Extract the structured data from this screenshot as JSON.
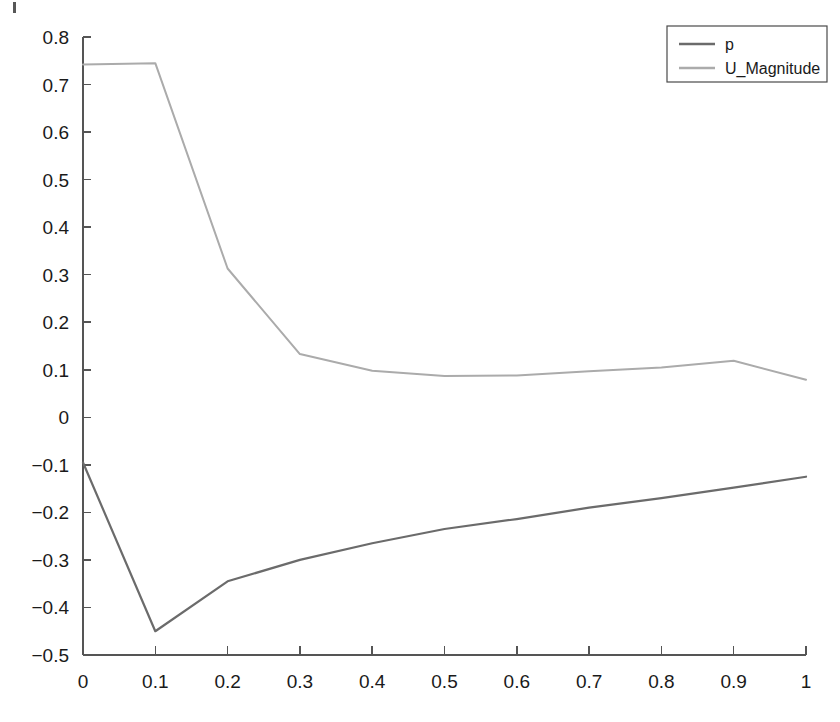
{
  "chart_data": {
    "type": "line",
    "title": "",
    "xlabel": "",
    "ylabel": "",
    "x": [
      0,
      0.1,
      0.2,
      0.3,
      0.4,
      0.5,
      0.6,
      0.7,
      0.8,
      0.9,
      1
    ],
    "xlim": [
      0,
      1
    ],
    "ylim": [
      -0.5,
      0.8
    ],
    "xticks": [
      0,
      0.1,
      0.2,
      0.3,
      0.4,
      0.5,
      0.6,
      0.7,
      0.8,
      0.9,
      1
    ],
    "xtick_labels": [
      "0",
      "0.1",
      "0.2",
      "0.3",
      "0.4",
      "0.5",
      "0.6",
      "0.7",
      "0.8",
      "0.9",
      "1"
    ],
    "yticks": [
      -0.5,
      -0.4,
      -0.3,
      -0.2,
      -0.1,
      0,
      0.1,
      0.2,
      0.3,
      0.4,
      0.5,
      0.6,
      0.7,
      0.8
    ],
    "ytick_labels": [
      "-0.5",
      "-0.4",
      "-0.3",
      "-0.2",
      "-0.1",
      "0",
      "0.1",
      "0.2",
      "0.3",
      "0.4",
      "0.5",
      "0.6",
      "0.7",
      "0.8"
    ],
    "grid": false,
    "legend_position": "top-right",
    "series": [
      {
        "name": "p",
        "color": "#6b6b6b",
        "line_width": 2.2,
        "values": [
          -0.095,
          -0.45,
          -0.345,
          -0.3,
          -0.265,
          -0.235,
          -0.214,
          -0.19,
          -0.17,
          -0.148,
          -0.125
        ]
      },
      {
        "name": "U_Magnitude",
        "color": "#ababab",
        "line_width": 2.0,
        "values": [
          0.742,
          0.745,
          0.313,
          0.133,
          0.098,
          0.087,
          0.088,
          0.097,
          0.105,
          0.119,
          0.079
        ]
      }
    ]
  },
  "legend": {
    "entries": [
      {
        "label": "p"
      },
      {
        "label": "U_Magnitude"
      }
    ]
  },
  "axis": {
    "x_axis_name": "x-axis",
    "y_axis_name": "y-axis"
  }
}
